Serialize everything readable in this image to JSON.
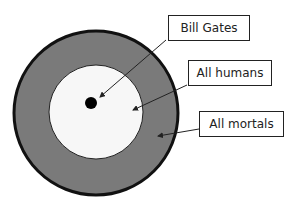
{
  "diagram": {
    "type": "nested-set",
    "labels": {
      "bill_gates": "Bill Gates",
      "all_humans": "All humans",
      "all_mortals": "All mortals"
    },
    "colors": {
      "outer_fill": "#7a7a7a",
      "outer_stroke": "#111111",
      "inner_fill": "#f7f7f7",
      "dot": "#000000"
    }
  }
}
